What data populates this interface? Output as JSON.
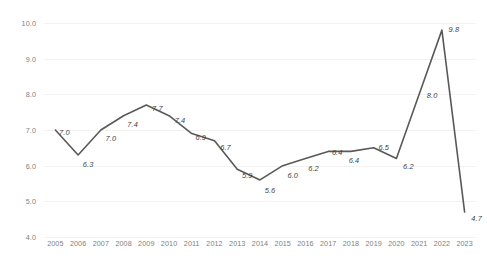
{
  "chart_data": {
    "type": "line",
    "title": "",
    "subtitle": "",
    "xlabel": "",
    "ylabel": "",
    "categories": [
      "2005",
      "2006",
      "2007",
      "2008",
      "2009",
      "2010",
      "2011",
      "2012",
      "2013",
      "2014",
      "2015",
      "2016",
      "2017",
      "2018",
      "2019",
      "2020",
      "2021",
      "2022",
      "2023"
    ],
    "values": [
      7.0,
      6.3,
      7.0,
      7.4,
      7.7,
      7.4,
      6.9,
      6.7,
      5.9,
      5.6,
      6.0,
      6.2,
      6.4,
      6.4,
      6.5,
      6.2,
      8.0,
      9.8,
      4.7
    ],
    "data_labels": [
      "7.0",
      "6.3",
      "7.0",
      "7.4",
      "7.7",
      "7.4",
      "6.9",
      "6.7",
      "5.9",
      "5.6",
      "6.0",
      "6.2",
      "6.4",
      "6.4",
      "6.5",
      "6.2",
      "8.0",
      "9.8",
      "4.7"
    ],
    "ylim": [
      4.0,
      10.0
    ],
    "ytick_values": [
      10.0,
      9.0,
      8.0,
      7.0,
      6.0,
      5.0,
      4.0
    ],
    "ytick_labels": [
      "10.0",
      "9.0",
      "8.0",
      "7.0",
      "6.0",
      "5.0",
      "4.0"
    ],
    "grid": true,
    "grid_axis": "y",
    "legend": false,
    "legend_position": "none",
    "series_color": "#595959",
    "gridline_color": "#f2f2f2",
    "tick_label_color": "#808080",
    "data_label_color": "#3f3f3f",
    "background_color": "#ffffff",
    "line_width": 1.6,
    "markers": false,
    "label_offsets": [
      {
        "dx": 9,
        "dy": 2
      },
      {
        "dx": 10,
        "dy": 9
      },
      {
        "dx": 10,
        "dy": 8
      },
      {
        "dx": 9,
        "dy": 8
      },
      {
        "dx": 11,
        "dy": 3
      },
      {
        "dx": 11,
        "dy": 4
      },
      {
        "dx": 9,
        "dy": 3
      },
      {
        "dx": 11,
        "dy": 6
      },
      {
        "dx": 10,
        "dy": 6
      },
      {
        "dx": 10,
        "dy": 10
      },
      {
        "dx": 10,
        "dy": 9
      },
      {
        "dx": 8,
        "dy": 9
      },
      {
        "dx": 9,
        "dy": 1
      },
      {
        "dx": 3,
        "dy": 9
      },
      {
        "dx": 10,
        "dy": -1
      },
      {
        "dx": 12,
        "dy": 7
      },
      {
        "dx": 13,
        "dy": 1
      },
      {
        "dx": 12,
        "dy": -1
      },
      {
        "dx": 12,
        "dy": 6
      }
    ]
  }
}
